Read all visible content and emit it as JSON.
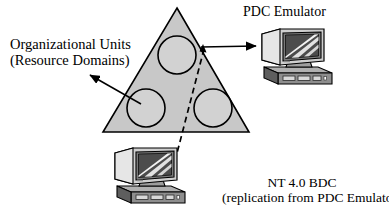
{
  "diagram": {
    "title_text_blocks": {
      "organizational_units": {
        "line1": "Organizational Units",
        "line2": "(Resource Domains)"
      },
      "pdc_emulator": "PDC Emulator",
      "nt4_bdc": {
        "line1": "NT 4.0 BDC",
        "line2": "(replication from PDC Emulator)"
      }
    },
    "shapes": {
      "triangle": {
        "label": "forest-triangle",
        "fill": "#c8c8c8",
        "stroke": "#000000",
        "apex": [
          177,
          8
        ],
        "left": [
          103,
          132
        ],
        "right": [
          249,
          132
        ]
      },
      "circles": [
        {
          "label": "organizational-unit-top",
          "cx": 177,
          "cy": 55,
          "r": 19
        },
        {
          "label": "organizational-unit-bottom-left",
          "cx": 146,
          "cy": 108,
          "r": 19
        },
        {
          "label": "organizational-unit-bottom-right",
          "cx": 213,
          "cy": 108,
          "r": 19
        }
      ]
    },
    "connectors": {
      "arrow_to_pdc": {
        "from": [
          203,
          47
        ],
        "to": [
          259,
          46
        ]
      },
      "arrow_to_ou_label": {
        "from": [
          141,
          104
        ],
        "to": [
          87,
          73
        ]
      },
      "dashed_replication_line": {
        "from": [
          204,
          49
        ],
        "to": [
          169,
          182
        ]
      }
    },
    "computers": [
      {
        "label": "pdc-emulator-computer",
        "x": 254,
        "y": 27
      },
      {
        "label": "nt4-bdc-computer",
        "x": 108,
        "y": 146
      }
    ],
    "colors": {
      "triangle_fill": "#c8c8c8",
      "circle_fill": "#d2d2d2",
      "line": "#000000",
      "monitor_light": "#e8e8e8",
      "monitor_mid": "#b4b4b4",
      "monitor_dark": "#5a5a5a",
      "screen_dark": "#4a4a4a",
      "case_mid": "#9a9a9a",
      "case_dark": "#3c3c3c",
      "background": "#ffffff"
    }
  }
}
